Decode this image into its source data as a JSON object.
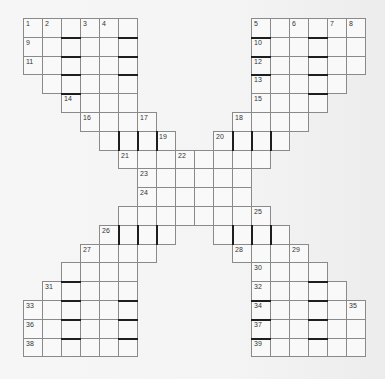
{
  "puzzle": {
    "title": "",
    "grid": {
      "origin_x": 23,
      "origin_y": 18,
      "cell_w": 19,
      "cell_h": 18.8,
      "line_color": "#8a8a8a",
      "bar_color": "#1e1e1e",
      "cell_fill": "#f9f9f9"
    },
    "rows": [
      {
        "r": 0,
        "segments": [
          [
            0,
            5
          ],
          [
            12,
            17
          ]
        ]
      },
      {
        "r": 1,
        "segments": [
          [
            0,
            5
          ],
          [
            12,
            17
          ]
        ]
      },
      {
        "r": 2,
        "segments": [
          [
            0,
            5
          ],
          [
            12,
            17
          ]
        ]
      },
      {
        "r": 3,
        "segments": [
          [
            1,
            5
          ],
          [
            12,
            16
          ]
        ]
      },
      {
        "r": 4,
        "segments": [
          [
            2,
            5
          ],
          [
            12,
            15
          ]
        ]
      },
      {
        "r": 5,
        "segments": [
          [
            3,
            6
          ],
          [
            11,
            14
          ]
        ]
      },
      {
        "r": 6,
        "segments": [
          [
            4,
            7
          ],
          [
            10,
            13
          ]
        ]
      },
      {
        "r": 7,
        "segments": [
          [
            5,
            12
          ]
        ]
      },
      {
        "r": 8,
        "segments": [
          [
            6,
            11
          ]
        ]
      },
      {
        "r": 9,
        "segments": [
          [
            6,
            11
          ]
        ]
      },
      {
        "r": 10,
        "segments": [
          [
            5,
            12
          ]
        ]
      },
      {
        "r": 11,
        "segments": [
          [
            4,
            7
          ],
          [
            10,
            13
          ]
        ]
      },
      {
        "r": 12,
        "segments": [
          [
            3,
            6
          ],
          [
            11,
            14
          ]
        ]
      },
      {
        "r": 13,
        "segments": [
          [
            2,
            5
          ],
          [
            12,
            15
          ]
        ]
      },
      {
        "r": 14,
        "segments": [
          [
            1,
            5
          ],
          [
            12,
            16
          ]
        ]
      },
      {
        "r": 15,
        "segments": [
          [
            0,
            5
          ],
          [
            12,
            17
          ]
        ]
      },
      {
        "r": 16,
        "segments": [
          [
            0,
            5
          ],
          [
            12,
            17
          ]
        ]
      },
      {
        "r": 17,
        "segments": [
          [
            0,
            5
          ],
          [
            12,
            17
          ]
        ]
      }
    ],
    "numbers": [
      {
        "n": "1",
        "r": 0,
        "c": 0
      },
      {
        "n": "2",
        "r": 0,
        "c": 1
      },
      {
        "n": "3",
        "r": 0,
        "c": 3
      },
      {
        "n": "4",
        "r": 0,
        "c": 4
      },
      {
        "n": "5",
        "r": 0,
        "c": 12
      },
      {
        "n": "6",
        "r": 0,
        "c": 14
      },
      {
        "n": "7",
        "r": 0,
        "c": 16
      },
      {
        "n": "8",
        "r": 0,
        "c": 17
      },
      {
        "n": "9",
        "r": 1,
        "c": 0
      },
      {
        "n": "10",
        "r": 1,
        "c": 12
      },
      {
        "n": "11",
        "r": 2,
        "c": 0
      },
      {
        "n": "12",
        "r": 2,
        "c": 12
      },
      {
        "n": "13",
        "r": 3,
        "c": 12
      },
      {
        "n": "14",
        "r": 4,
        "c": 2
      },
      {
        "n": "15",
        "r": 4,
        "c": 12
      },
      {
        "n": "16",
        "r": 5,
        "c": 3
      },
      {
        "n": "17",
        "r": 5,
        "c": 6
      },
      {
        "n": "18",
        "r": 5,
        "c": 11
      },
      {
        "n": "19",
        "r": 6,
        "c": 7
      },
      {
        "n": "20",
        "r": 6,
        "c": 10
      },
      {
        "n": "21",
        "r": 7,
        "c": 5
      },
      {
        "n": "22",
        "r": 7,
        "c": 8
      },
      {
        "n": "23",
        "r": 8,
        "c": 6
      },
      {
        "n": "24",
        "r": 9,
        "c": 6
      },
      {
        "n": "25",
        "r": 10,
        "c": 12
      },
      {
        "n": "26",
        "r": 11,
        "c": 4
      },
      {
        "n": "27",
        "r": 12,
        "c": 3
      },
      {
        "n": "28",
        "r": 12,
        "c": 11
      },
      {
        "n": "29",
        "r": 12,
        "c": 14
      },
      {
        "n": "30",
        "r": 13,
        "c": 12
      },
      {
        "n": "31",
        "r": 14,
        "c": 1
      },
      {
        "n": "32",
        "r": 14,
        "c": 12
      },
      {
        "n": "33",
        "r": 15,
        "c": 0
      },
      {
        "n": "34",
        "r": 15,
        "c": 12
      },
      {
        "n": "35",
        "r": 15,
        "c": 17
      },
      {
        "n": "36",
        "r": 16,
        "c": 0
      },
      {
        "n": "37",
        "r": 16,
        "c": 12
      },
      {
        "n": "38",
        "r": 17,
        "c": 0
      },
      {
        "n": "39",
        "r": 17,
        "c": 12
      }
    ],
    "thick_top_bars": [
      [
        1,
        2
      ],
      [
        1,
        5
      ],
      [
        2,
        2
      ],
      [
        2,
        5
      ],
      [
        3,
        2
      ],
      [
        3,
        5
      ],
      [
        4,
        2
      ],
      [
        1,
        12
      ],
      [
        1,
        15
      ],
      [
        2,
        12
      ],
      [
        2,
        15
      ],
      [
        3,
        12
      ],
      [
        3,
        15
      ],
      [
        4,
        15
      ],
      [
        14,
        2
      ],
      [
        15,
        2
      ],
      [
        15,
        5
      ],
      [
        16,
        2
      ],
      [
        16,
        5
      ],
      [
        17,
        2
      ],
      [
        17,
        5
      ],
      [
        14,
        15
      ],
      [
        15,
        12
      ],
      [
        15,
        15
      ],
      [
        16,
        12
      ],
      [
        16,
        15
      ],
      [
        17,
        12
      ],
      [
        17,
        15
      ]
    ],
    "thick_left_bars": [
      [
        6,
        5
      ],
      [
        6,
        6
      ],
      [
        6,
        7
      ],
      [
        6,
        11
      ],
      [
        6,
        12
      ],
      [
        6,
        13
      ],
      [
        11,
        5
      ],
      [
        11,
        6
      ],
      [
        11,
        7
      ],
      [
        11,
        11
      ],
      [
        11,
        12
      ],
      [
        11,
        13
      ]
    ]
  }
}
